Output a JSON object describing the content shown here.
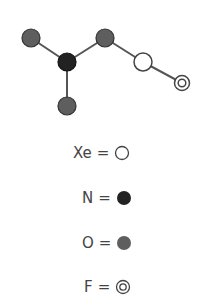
{
  "molecule": {
    "atoms": [
      {
        "id": "o_left",
        "element": "O",
        "x": 31,
        "y": 38
      },
      {
        "id": "n_center",
        "element": "N",
        "x": 67,
        "y": 62
      },
      {
        "id": "o_bottom",
        "element": "O",
        "x": 67,
        "y": 106
      },
      {
        "id": "o_right",
        "element": "O",
        "x": 105,
        "y": 38
      },
      {
        "id": "xe",
        "element": "Xe",
        "x": 143,
        "y": 62
      },
      {
        "id": "f",
        "element": "F",
        "x": 182,
        "y": 83
      }
    ],
    "bonds": [
      [
        "o_left",
        "n_center"
      ],
      [
        "n_center",
        "o_bottom"
      ],
      [
        "n_center",
        "o_right"
      ],
      [
        "o_right",
        "xe"
      ],
      [
        "xe",
        "f"
      ]
    ]
  },
  "legend": [
    {
      "symbol": "Xe",
      "eq": "=",
      "style": "open-circle"
    },
    {
      "symbol": "N",
      "eq": "=",
      "style": "black-circle"
    },
    {
      "symbol": "O",
      "eq": "=",
      "style": "gray-circle"
    },
    {
      "symbol": "F",
      "eq": "=",
      "style": "double-circle"
    }
  ],
  "colors": {
    "bond": "#555555",
    "n_fill": "#222222",
    "o_fill": "#5e5e5e",
    "outline": "#444444",
    "open_fill": "#ffffff"
  }
}
